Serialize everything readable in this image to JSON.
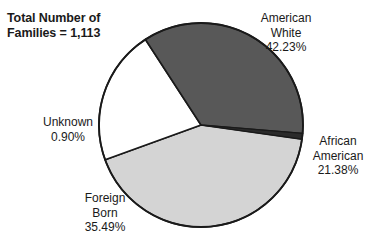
{
  "chart_data": {
    "type": "pie",
    "title": "Total Number of Families = 1,113",
    "title_lines": [
      "Total Number of",
      "Families = 1,113"
    ],
    "total_label": "Total Number of Families",
    "total_value": "1,113",
    "xlabel": "",
    "ylabel": "",
    "legend_position": "none",
    "grid": false,
    "categories": [
      "American White",
      "African American",
      "Foreign Born",
      "Unknown"
    ],
    "values": [
      42.23,
      21.38,
      35.49,
      0.9
    ],
    "units": "percent",
    "slices": [
      {
        "name": "american-white",
        "label_lines": [
          "American",
          "White"
        ],
        "value_label": "42.23%",
        "value": 42.23,
        "color": "#d4d4d4"
      },
      {
        "name": "african-american",
        "label_lines": [
          "African",
          "American"
        ],
        "value_label": "21.38%",
        "value": 21.38,
        "color": "#ffffff"
      },
      {
        "name": "foreign-born",
        "label_lines": [
          "Foreign",
          "Born"
        ],
        "value_label": "35.49%",
        "value": 35.49,
        "color": "#585858"
      },
      {
        "name": "unknown",
        "label_lines": [
          "Unknown"
        ],
        "value_label": "0.90%",
        "value": 0.9,
        "color": "#2b2b2b"
      }
    ]
  },
  "colors": {
    "outline": "#1a1a1a",
    "text": "#1a1a1a",
    "background": "#ffffff",
    "american_white": "#d4d4d4",
    "african_american": "#ffffff",
    "foreign_born": "#585858",
    "unknown": "#2b2b2b"
  },
  "labels": {
    "american_white": {
      "line1": "American",
      "line2": "White",
      "pct": "42.23%"
    },
    "african_american": {
      "line1": "African",
      "line2": "American",
      "pct": "21.38%"
    },
    "foreign_born": {
      "line1": "Foreign",
      "line2": "Born",
      "pct": "35.49%"
    },
    "unknown": {
      "line1": "Unknown",
      "pct": "0.90%"
    }
  }
}
